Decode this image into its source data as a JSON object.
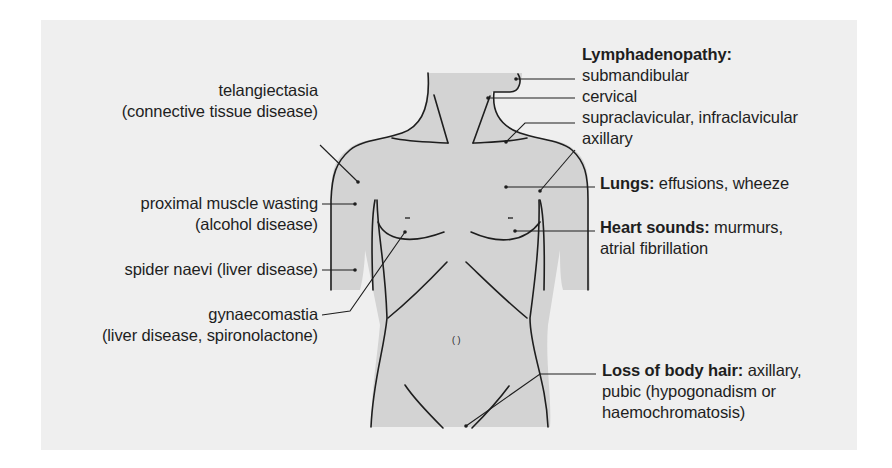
{
  "figure": {
    "colors": {
      "background": "#ffffff",
      "panel": "#efefef",
      "body_fill": "#d3d3d3",
      "outline": "#1e1e1e",
      "text": "#1e1e1e"
    }
  },
  "labels_left": [
    {
      "id": "telangiectasia",
      "lines": [
        "telangiectasia",
        "(connective tissue disease)"
      ]
    },
    {
      "id": "proximal-muscle-wasting",
      "lines": [
        "proximal muscle wasting",
        "(alcohol disease)"
      ]
    },
    {
      "id": "spider-naevi",
      "lines": [
        "spider naevi (liver disease)"
      ]
    },
    {
      "id": "gynaecomastia",
      "lines": [
        "gynaecomastia",
        "(liver disease, spironolactone)"
      ]
    }
  ],
  "labels_right": {
    "lymphadenopathy": {
      "heading": "Lymphadenopathy:",
      "items": [
        "submandibular",
        "cervical",
        "supraclavicular, infraclavicular",
        "axillary"
      ]
    },
    "lungs": {
      "heading": "Lungs:",
      "text": " effusions, wheeze"
    },
    "heart": {
      "heading": "Heart sounds:",
      "text": " murmurs,",
      "line2": "atrial fibrillation"
    },
    "hair": {
      "heading": "Loss of body hair:",
      "text": " axillary,",
      "line2": "pubic (hypogonadism or",
      "line3": "haemochromatosis)"
    }
  },
  "navel_glyph": "(ᐩ)"
}
